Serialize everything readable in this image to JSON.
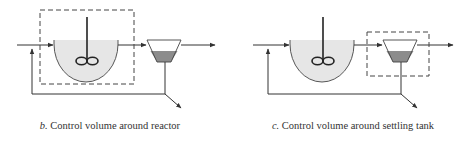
{
  "figures": [
    {
      "id": "b",
      "label": "b.",
      "caption": "Control volume around reactor",
      "control_volume_around": "reactor"
    },
    {
      "id": "c",
      "label": "c.",
      "caption": "Control volume around settling tank",
      "control_volume_around": "settling tank"
    }
  ],
  "colors": {
    "line": "#333333",
    "dashed_box": "#444444",
    "reactor_fill": "#e6e6e6",
    "sludge_fill": "#8c8c8c",
    "background": "#ffffff"
  },
  "components": [
    "inlet",
    "reactor-with-impeller",
    "settling-tank",
    "effluent",
    "recycle-line",
    "waste-sludge"
  ]
}
